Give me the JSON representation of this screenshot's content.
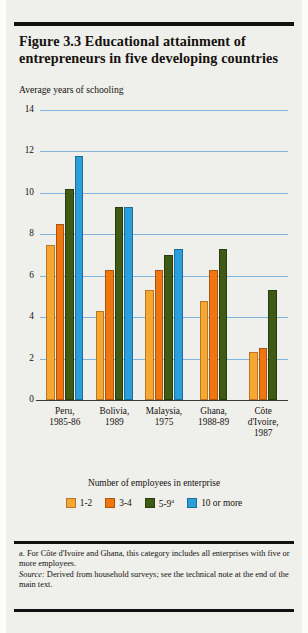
{
  "figure": {
    "title": "Figure 3.3  Educational attainment of entrepreneurs in five developing countries",
    "subtitle": "Average years of schooling",
    "legend_title": "Number of employees in enterprise",
    "footnote_a": "a. For Côte d'Ivoire and Ghana, this category includes all enterprises with five or more employees.",
    "source_word": "Source:",
    "source_text": " Derived from household surveys; see the technical note at the end of the main text."
  },
  "colors": {
    "series_1_2": "#f7a830",
    "series_3_4": "#f0770f",
    "series_5_9": "#3f5a15",
    "series_10_plus": "#2a9fdb",
    "gridline": "#7fb4dd",
    "background": "#efefeb",
    "text": "#15120f"
  },
  "chart_data": {
    "type": "bar",
    "title": "Figure 3.3  Educational attainment of entrepreneurs in five developing countries",
    "subtitle": "Average years of schooling",
    "xlabel": "",
    "ylabel": "Average years of schooling",
    "ylim": [
      0,
      14
    ],
    "yticks": [
      0,
      2,
      4,
      6,
      8,
      10,
      12,
      14
    ],
    "ytick_labels": [
      "0",
      "2",
      "4",
      "6",
      "8",
      "10",
      "12",
      "14"
    ],
    "grid": true,
    "legend_position": "bottom",
    "legend_title": "Number of employees in enterprise",
    "categories": [
      "Peru,\n1985-86",
      "Bolivia,\n1989",
      "Malaysia,\n1975",
      "Ghana,\n1988-89",
      "Côte\nd'Ivoire,\n1987"
    ],
    "series": [
      {
        "name": "1-2",
        "values": [
          7.5,
          4.3,
          5.3,
          4.8,
          2.3
        ]
      },
      {
        "name": "3-4",
        "values": [
          8.5,
          6.3,
          6.3,
          6.3,
          2.5
        ]
      },
      {
        "name": "5-9 a",
        "values": [
          10.2,
          9.3,
          7.0,
          7.3,
          5.3
        ]
      },
      {
        "name": "10 or more",
        "values": [
          11.8,
          9.3,
          7.3,
          null,
          null
        ]
      }
    ]
  }
}
